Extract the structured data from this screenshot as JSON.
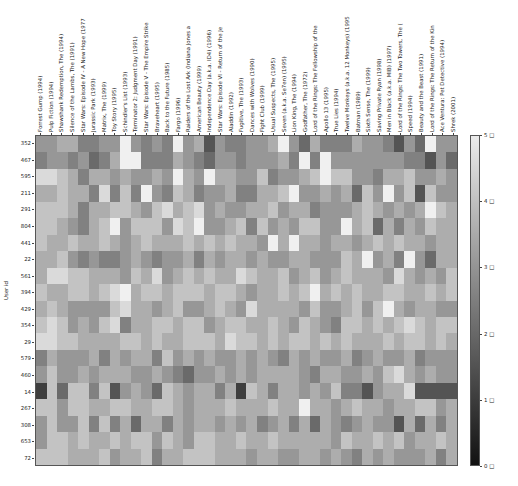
{
  "chart_data": {
    "type": "heatmap",
    "title": "",
    "xlabel": "",
    "ylabel": "User id",
    "colormap": "gray",
    "vmin": 0,
    "vmax": 5,
    "colorbar": {
      "ticks": [
        "0 □",
        "1 □",
        "2 □",
        "3 □",
        "4 □",
        "5 □"
      ],
      "values": [
        0,
        1,
        2,
        3,
        4,
        5
      ]
    },
    "columns": [
      "Forrest Gump (1994)",
      "Pulp Fiction (1994)",
      "Shawshank Redemption, The (1994)",
      "Silence of the Lambs, The (1991)",
      "Star Wars: Episode IV - A New Hope (1977",
      "Jurassic Park (1993)",
      "Matrix, The (1999)",
      "Toy Story (1995)",
      "Schindler's List (1993)",
      "Terminator 2: Judgment Day (1991)",
      "Star Wars: Episode V - The Empire Strike",
      "Braveheart (1995)",
      "Back to the Future (1985)",
      "Fargo (1996)",
      "Raiders of the Lost Ark (Indiana Jones a",
      "American Beauty (1999)",
      "Independence Day (a.k.a. ID4) (1996)",
      "Star Wars: Episode VI - Return of the Je",
      "Aladdin (1992)",
      "Fugitive, The (1993)",
      "Dances with Wolves (1990)",
      "Fight Club (1999)",
      "Usual Suspects, The (1995)",
      "Seven (a.k.a. Se7en) (1995)",
      "Lion King, The (1994)",
      "Godfather, The (1972)",
      "Lord of the Rings: The Fellowship of the",
      "Apollo 13 (1995)",
      "True Lies (1994)",
      "Twelve Monkeys (a.k.a. 12 Monkeys) (1995",
      "Batman (1989)",
      "Sixth Sense, The (1999)",
      "Saving Private Ryan (1998)",
      "Men in Black (a.k.a. MIB) (1997)",
      "Lord of the Rings: The Two Towers, The (",
      "Speed (1994)",
      "Beauty and the Beast (1991)",
      "Lord of the Rings: The Return of the Kin",
      "Ace Ventura: Pet Detective (1994)",
      "Shrek (2001)"
    ],
    "rows": [
      "352",
      "467",
      "595",
      "211",
      "291",
      "804",
      "441",
      "22",
      "561",
      "394",
      "429",
      "354",
      "29",
      "579",
      "460",
      "14",
      "267",
      "308",
      "653",
      "72"
    ],
    "values": [
      [
        3.0,
        3.0,
        3.5,
        3.5,
        2.5,
        2.5,
        3.0,
        3.0,
        5.0,
        3.0,
        2.5,
        3.0,
        2.5,
        5.0,
        3.0,
        3.5,
        1.5,
        3.0,
        2.5,
        2.5,
        3.0,
        3.0,
        3.5,
        5.0,
        3.0,
        2.0,
        3.5,
        2.5,
        2.5,
        2.5,
        3.5,
        3.0,
        3.0,
        2.5,
        1.5,
        3.0,
        2.0,
        5.0,
        3.0,
        3.0
      ],
      [
        2.5,
        3.0,
        3.0,
        2.5,
        3.0,
        2.0,
        2.5,
        3.5,
        5.0,
        5.0,
        2.5,
        2.5,
        2.5,
        3.5,
        3.0,
        2.5,
        2.0,
        3.0,
        3.0,
        2.5,
        3.0,
        3.0,
        3.0,
        3.5,
        2.5,
        5.0,
        2.5,
        5.0,
        3.0,
        3.0,
        3.0,
        3.0,
        3.0,
        3.0,
        3.0,
        2.5,
        2.5,
        1.5,
        3.0,
        2.0
      ],
      [
        4.5,
        4.5,
        4.0,
        3.5,
        2.5,
        3.5,
        3.5,
        3.0,
        3.5,
        3.0,
        3.0,
        3.5,
        3.0,
        5.0,
        3.5,
        3.0,
        5.0,
        3.5,
        3.5,
        3.0,
        3.0,
        4.0,
        2.5,
        3.0,
        3.0,
        3.5,
        4.0,
        5.0,
        4.0,
        4.0,
        3.0,
        3.0,
        2.5,
        3.5,
        3.5,
        4.0,
        3.0,
        3.0,
        3.5,
        3.0
      ],
      [
        3.5,
        3.5,
        4.0,
        3.5,
        3.5,
        2.5,
        4.5,
        2.5,
        4.0,
        2.5,
        5.0,
        3.0,
        2.5,
        4.0,
        3.5,
        2.5,
        3.0,
        3.0,
        3.5,
        2.5,
        2.5,
        3.5,
        3.5,
        4.0,
        5.0,
        3.0,
        3.0,
        3.5,
        3.0,
        3.5,
        2.0,
        4.0,
        3.0,
        5.0,
        3.0,
        4.0,
        1.5,
        4.0,
        3.0,
        3.0
      ],
      [
        4.0,
        4.0,
        4.0,
        3.5,
        2.5,
        3.5,
        3.5,
        4.0,
        4.0,
        3.5,
        3.0,
        4.0,
        4.5,
        3.5,
        4.0,
        4.5,
        3.0,
        3.5,
        3.0,
        3.0,
        3.5,
        3.5,
        4.0,
        3.0,
        3.5,
        3.5,
        2.5,
        3.0,
        3.0,
        3.0,
        3.5,
        4.0,
        3.5,
        3.0,
        3.5,
        3.0,
        3.5,
        5.0,
        4.0,
        3.5
      ],
      [
        4.0,
        4.0,
        3.5,
        3.0,
        2.5,
        3.5,
        4.0,
        5.0,
        3.0,
        4.0,
        4.0,
        4.0,
        3.0,
        4.5,
        4.0,
        5.0,
        3.0,
        3.0,
        3.5,
        4.0,
        2.5,
        4.0,
        3.0,
        3.5,
        3.0,
        4.0,
        4.0,
        3.0,
        3.0,
        5.0,
        3.5,
        4.0,
        2.0,
        3.5,
        2.5,
        3.5,
        3.0,
        4.0,
        3.5,
        3.5
      ],
      [
        4.0,
        3.5,
        3.5,
        4.0,
        3.5,
        3.5,
        4.0,
        3.5,
        3.0,
        3.5,
        4.0,
        3.5,
        3.5,
        3.5,
        4.0,
        3.5,
        4.0,
        3.5,
        4.0,
        3.5,
        3.5,
        3.0,
        5.0,
        3.5,
        5.0,
        3.5,
        3.5,
        3.0,
        3.5,
        3.5,
        3.0,
        3.5,
        4.0,
        3.5,
        4.0,
        3.5,
        3.5,
        3.0,
        3.5,
        3.5
      ],
      [
        3.5,
        3.5,
        4.0,
        3.0,
        2.5,
        3.0,
        2.5,
        2.5,
        3.0,
        3.5,
        3.0,
        2.5,
        3.0,
        3.0,
        3.5,
        2.5,
        3.5,
        3.0,
        3.5,
        3.5,
        3.0,
        3.5,
        3.0,
        3.0,
        3.5,
        3.5,
        3.0,
        3.0,
        3.0,
        4.0,
        3.5,
        5.0,
        3.0,
        3.5,
        2.5,
        5.0,
        3.0,
        2.0,
        3.5,
        3.5
      ],
      [
        3.5,
        4.5,
        4.5,
        4.0,
        4.0,
        3.5,
        3.5,
        3.5,
        3.0,
        4.0,
        3.5,
        4.5,
        3.0,
        3.5,
        4.0,
        3.5,
        4.0,
        3.5,
        3.5,
        4.5,
        4.0,
        3.5,
        3.5,
        4.0,
        3.0,
        3.5,
        4.0,
        3.0,
        3.5,
        4.0,
        3.5,
        3.5,
        3.5,
        3.0,
        4.5,
        3.5,
        3.0,
        3.5,
        3.0,
        4.0
      ],
      [
        4.0,
        3.5,
        3.5,
        4.0,
        4.0,
        3.5,
        4.0,
        4.5,
        5.0,
        3.5,
        4.0,
        4.0,
        3.5,
        4.0,
        4.0,
        4.0,
        3.5,
        4.0,
        4.0,
        3.5,
        3.0,
        3.5,
        3.5,
        4.0,
        3.5,
        4.0,
        5.0,
        3.5,
        4.0,
        3.5,
        4.0,
        3.5,
        3.5,
        4.0,
        4.0,
        3.5,
        3.5,
        4.0,
        3.5,
        4.0
      ],
      [
        3.5,
        4.0,
        3.5,
        3.0,
        3.0,
        3.0,
        3.0,
        4.0,
        4.5,
        3.5,
        3.5,
        3.0,
        3.5,
        4.0,
        3.0,
        3.0,
        3.5,
        4.0,
        3.5,
        3.0,
        4.5,
        3.5,
        3.5,
        3.5,
        3.5,
        3.0,
        4.0,
        3.0,
        3.0,
        3.5,
        4.0,
        3.0,
        4.0,
        5.0,
        3.5,
        3.0,
        3.5,
        3.5,
        3.0,
        3.0
      ],
      [
        4.0,
        4.5,
        4.0,
        3.0,
        3.5,
        3.0,
        4.0,
        4.5,
        2.5,
        3.5,
        3.5,
        4.0,
        4.0,
        3.5,
        4.0,
        4.0,
        3.0,
        3.5,
        4.0,
        4.0,
        3.5,
        3.5,
        4.0,
        3.5,
        3.0,
        4.0,
        3.5,
        3.0,
        2.5,
        4.0,
        4.0,
        3.5,
        4.0,
        3.5,
        4.0,
        4.5,
        4.0,
        3.5,
        4.0,
        4.0
      ],
      [
        4.5,
        4.5,
        4.0,
        4.0,
        3.5,
        3.5,
        3.5,
        3.5,
        4.0,
        4.0,
        3.5,
        4.0,
        3.5,
        3.5,
        4.0,
        4.0,
        4.0,
        3.5,
        4.5,
        4.0,
        4.0,
        3.5,
        4.0,
        3.5,
        4.0,
        4.0,
        3.5,
        4.0,
        3.5,
        4.0,
        3.5,
        3.5,
        3.5,
        4.0,
        3.5,
        4.0,
        4.0,
        3.5,
        4.0,
        3.5
      ],
      [
        2.5,
        3.5,
        3.0,
        3.0,
        3.0,
        3.5,
        2.5,
        3.5,
        3.0,
        3.5,
        3.5,
        2.5,
        4.0,
        3.0,
        3.5,
        3.0,
        3.5,
        3.0,
        3.0,
        3.5,
        3.0,
        3.5,
        3.0,
        2.5,
        3.5,
        3.0,
        3.5,
        3.0,
        3.0,
        3.5,
        2.5,
        3.0,
        3.5,
        3.0,
        3.0,
        3.5,
        2.5,
        3.0,
        3.0,
        3.0
      ],
      [
        3.0,
        4.0,
        3.0,
        3.0,
        3.5,
        3.0,
        3.5,
        3.5,
        3.5,
        3.0,
        3.0,
        3.5,
        3.0,
        2.5,
        2.0,
        3.0,
        3.0,
        3.5,
        3.0,
        3.5,
        3.0,
        3.5,
        3.5,
        3.5,
        3.5,
        3.0,
        2.5,
        3.5,
        3.5,
        3.0,
        3.0,
        3.5,
        3.0,
        4.0,
        4.5,
        3.5,
        3.0,
        3.5,
        3.0,
        3.0
      ],
      [
        1.0,
        4.0,
        2.0,
        4.0,
        4.0,
        2.5,
        4.0,
        1.5,
        3.0,
        3.5,
        3.0,
        2.0,
        4.0,
        3.5,
        3.0,
        3.5,
        3.5,
        2.5,
        3.5,
        1.0,
        4.0,
        3.5,
        2.5,
        3.5,
        3.5,
        3.0,
        3.5,
        3.0,
        4.0,
        2.5,
        2.5,
        1.5,
        3.0,
        3.5,
        3.5,
        4.5,
        1.5,
        1.5,
        1.5,
        1.5
      ],
      [
        4.0,
        4.0,
        3.0,
        4.0,
        4.0,
        3.5,
        3.5,
        4.0,
        4.0,
        3.5,
        3.5,
        4.0,
        4.0,
        3.5,
        3.0,
        3.5,
        3.5,
        3.5,
        4.0,
        3.5,
        3.5,
        3.5,
        4.0,
        3.5,
        3.5,
        5.0,
        3.5,
        3.5,
        3.0,
        3.5,
        4.0,
        3.5,
        3.5,
        3.0,
        3.5,
        3.5,
        4.0,
        4.0,
        3.0,
        3.5
      ],
      [
        3.0,
        4.0,
        3.0,
        3.0,
        4.0,
        2.5,
        4.0,
        2.5,
        3.5,
        2.0,
        3.5,
        3.5,
        2.5,
        3.5,
        3.0,
        3.5,
        3.5,
        3.0,
        3.5,
        3.0,
        3.5,
        2.5,
        3.0,
        3.5,
        2.5,
        3.5,
        2.0,
        3.5,
        3.0,
        2.5,
        3.0,
        3.5,
        3.0,
        3.0,
        1.5,
        3.5,
        2.0,
        3.5,
        2.5,
        3.5
      ],
      [
        3.0,
        4.0,
        4.0,
        3.5,
        4.0,
        3.5,
        3.5,
        4.0,
        3.5,
        4.0,
        4.0,
        3.0,
        4.0,
        3.5,
        3.0,
        4.0,
        4.0,
        3.5,
        3.5,
        4.0,
        3.5,
        3.5,
        4.0,
        3.5,
        3.5,
        3.5,
        3.5,
        3.5,
        3.0,
        4.0,
        3.5,
        3.5,
        4.0,
        3.5,
        4.0,
        3.0,
        3.5,
        3.5,
        4.0,
        3.5
      ],
      [
        4.0,
        4.0,
        4.0,
        3.5,
        3.5,
        3.5,
        4.0,
        3.0,
        3.5,
        3.5,
        4.0,
        2.5,
        3.5,
        3.5,
        4.0,
        4.0,
        4.0,
        3.5,
        3.5,
        3.5,
        3.0,
        3.5,
        3.5,
        3.0,
        3.0,
        3.5,
        3.5,
        3.0,
        3.5,
        3.0,
        2.5,
        3.5,
        3.0,
        3.5,
        3.0,
        3.0,
        3.0,
        3.5,
        2.5,
        3.5
      ]
    ],
    "note": "Values estimated from grayscale intensity; grid has ~50 columns visually, 40 representative labeled columns captured."
  }
}
